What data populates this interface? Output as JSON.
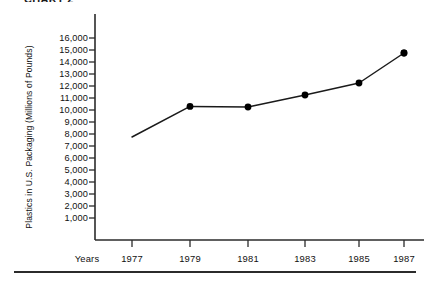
{
  "figure": {
    "caption": "CHART 2"
  },
  "chart_data": {
    "type": "line",
    "title": "",
    "xlabel": "Years",
    "ylabel": "Plastics in U.S. Packaging (Millions of Pounds)",
    "categories": [
      "1977",
      "1979",
      "1981",
      "1983",
      "1985",
      "1987"
    ],
    "x": [
      1977,
      1979,
      1981,
      1983,
      1985,
      1987
    ],
    "values": [
      7750,
      10300,
      10250,
      11250,
      12250,
      14750
    ],
    "series": [
      {
        "name": "Plastics in U.S. Packaging",
        "values": [
          7750,
          10300,
          10250,
          11250,
          12250,
          14750
        ]
      }
    ],
    "ylim": [
      0,
      16500
    ],
    "yticks": [
      1000,
      2000,
      3000,
      4000,
      5000,
      6000,
      7000,
      8000,
      9000,
      10000,
      11000,
      12000,
      13000,
      14000,
      15000,
      16000
    ],
    "ytick_labels": [
      "1,000",
      "2,000",
      "3,000",
      "4,000",
      "5,000",
      "6,000",
      "7,000",
      "8,000",
      "9,000",
      "10,000",
      "11,000",
      "12,000",
      "13,000",
      "14,000",
      "15,000",
      "16,000"
    ],
    "xtick_labels": [
      "1977",
      "1979",
      "1981",
      "1983",
      "1985",
      "1987"
    ],
    "grid": false,
    "legend": "none",
    "line_color": "#1a1a1a",
    "marker_color": "#000000",
    "marker_shape": "circle",
    "axis_color": "#2b2b2b"
  }
}
